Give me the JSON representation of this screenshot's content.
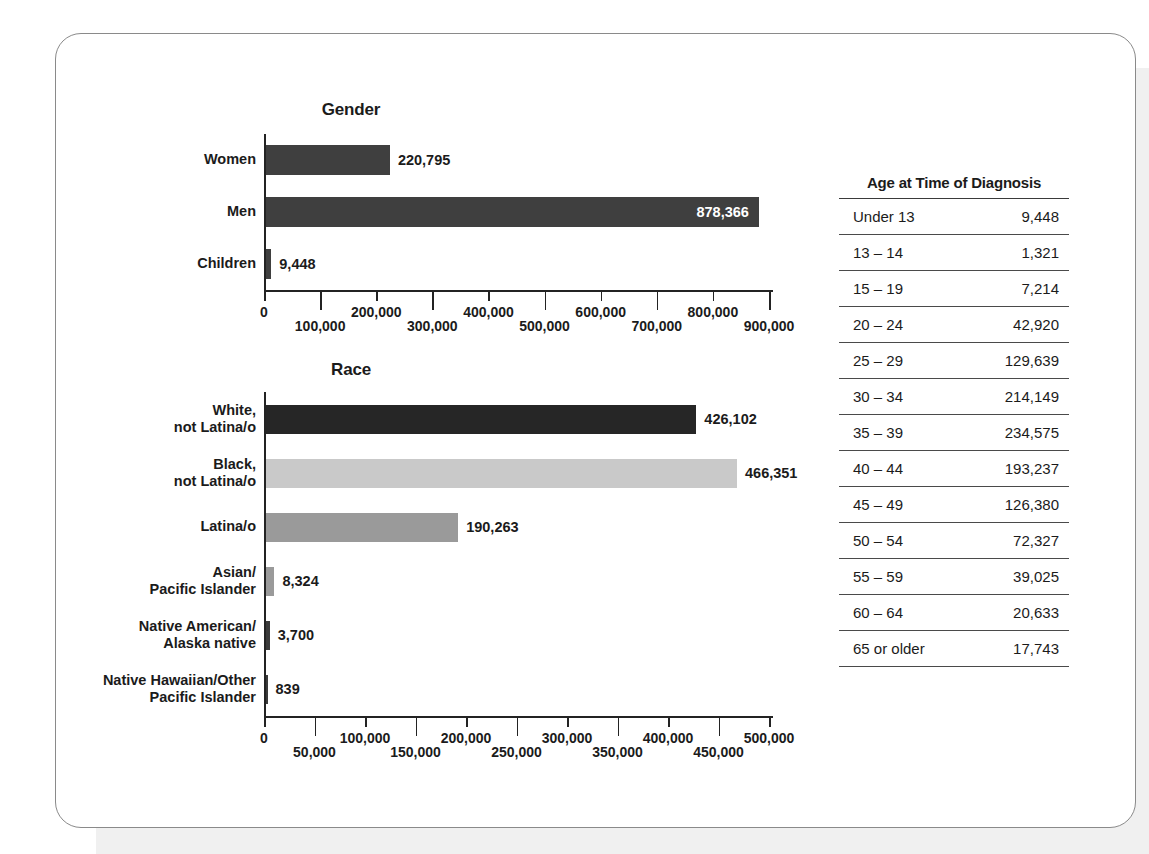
{
  "chart_data": [
    {
      "type": "bar",
      "orientation": "horizontal",
      "title": "Gender",
      "xlabel": "",
      "ylabel": "",
      "xlim": [
        0,
        900000
      ],
      "tick_step": 100000,
      "grid": false,
      "legend": "none",
      "categories": [
        "Women",
        "Men",
        "Children"
      ],
      "values": [
        220795,
        878366,
        9448
      ],
      "value_labels": [
        "220,795",
        "878,366",
        "9,448"
      ],
      "label_inside": [
        false,
        true,
        false
      ],
      "bar_colors": [
        "#3f3f3f",
        "#3f3f3f",
        "#3f3f3f"
      ],
      "tick_labels": [
        "0",
        "100,000",
        "200,000",
        "300,000",
        "400,000",
        "500,000",
        "600,000",
        "700,000",
        "800,000",
        "900,000"
      ]
    },
    {
      "type": "bar",
      "orientation": "horizontal",
      "title": "Race",
      "xlabel": "",
      "ylabel": "",
      "xlim": [
        0,
        500000
      ],
      "tick_step": 50000,
      "grid": false,
      "legend": "none",
      "categories": [
        "White,\nnot Latina/o",
        "Black,\nnot Latina/o",
        "Latina/o",
        "Asian/\nPacific Islander",
        "Native American/\nAlaska native",
        "Native Hawaiian/Other\nPacific Islander"
      ],
      "values": [
        426102,
        466351,
        190263,
        8324,
        3700,
        839
      ],
      "value_labels": [
        "426,102",
        "466,351",
        "190,263",
        "8,324",
        "3,700",
        "839"
      ],
      "label_inside": [
        false,
        false,
        false,
        false,
        false,
        false
      ],
      "bar_colors": [
        "#262626",
        "#c9c9c9",
        "#9a9a9a",
        "#9a9a9a",
        "#3a3a3a",
        "#3a3a3a"
      ],
      "tick_labels": [
        "0",
        "50,000",
        "100,000",
        "150,000",
        "200,000",
        "250,000",
        "300,000",
        "350,000",
        "400,000",
        "450,000",
        "500,000"
      ]
    },
    {
      "type": "table",
      "title": "Age at Time of Diagnosis",
      "columns": [
        "Age at Time of Diagnosis",
        ""
      ],
      "rows": [
        [
          "Under 13",
          "9,448"
        ],
        [
          "13 – 14",
          "1,321"
        ],
        [
          "15 – 19",
          "7,214"
        ],
        [
          "20 – 24",
          "42,920"
        ],
        [
          "25 – 29",
          "129,639"
        ],
        [
          "30 – 34",
          "214,149"
        ],
        [
          "35 – 39",
          "234,575"
        ],
        [
          "40 – 44",
          "193,237"
        ],
        [
          "45 – 49",
          "126,380"
        ],
        [
          "50 – 54",
          "72,327"
        ],
        [
          "55 – 59",
          "39,025"
        ],
        [
          "60 – 64",
          "20,633"
        ],
        [
          "65 or older",
          "17,743"
        ]
      ]
    }
  ],
  "colors": {
    "ink": "#1b1b1b",
    "axis": "#232323",
    "card_border": "#8a8a8a",
    "artifact_gray": "#f0f0f0"
  }
}
